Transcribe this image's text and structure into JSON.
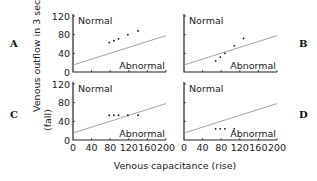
{
  "figure": {
    "ylabel_line1": "Venous outflow in 3 seconds",
    "ylabel_line2": "(fall)",
    "xlabel": "Venous capacitance (rise)",
    "region_labels": {
      "normal": "Normal",
      "abnormal": "Abnormal"
    },
    "y_ticks": [
      "0",
      "40",
      "80",
      "120"
    ],
    "x_ticks": [
      "0",
      "40",
      "80",
      "120",
      "160",
      "200"
    ],
    "colors": {
      "points": "#111111",
      "axis": "#222222",
      "reference_line": "#9a9a9a"
    }
  },
  "chart_data": [
    {
      "panel": "A",
      "type": "scatter",
      "xlabel": "Venous capacitance (rise)",
      "ylabel": "Venous outflow in 3 seconds (fall)",
      "xlim": [
        0,
        200
      ],
      "ylim": [
        0,
        120
      ],
      "x": [
        78,
        88,
        98,
        118,
        140
      ],
      "y": [
        63,
        67,
        71,
        80,
        88
      ],
      "reference_line": {
        "x": [
          0,
          200
        ],
        "y": [
          15,
          78
        ]
      },
      "annotations": [
        "Normal",
        "Abnormal"
      ]
    },
    {
      "panel": "B",
      "type": "scatter",
      "xlabel": "Venous capacitance (rise)",
      "ylabel": "Venous outflow in 3 seconds (fall)",
      "xlim": [
        0,
        200
      ],
      "ylim": [
        0,
        120
      ],
      "x": [
        68,
        78,
        88,
        108,
        128
      ],
      "y": [
        24,
        32,
        40,
        56,
        72
      ],
      "reference_line": {
        "x": [
          0,
          200
        ],
        "y": [
          15,
          78
        ]
      },
      "annotations": [
        "Normal",
        "Abnormal"
      ]
    },
    {
      "panel": "C",
      "type": "scatter",
      "xlabel": "Venous capacitance (rise)",
      "ylabel": "Venous outflow in 3 seconds (fall)",
      "xlim": [
        0,
        200
      ],
      "ylim": [
        0,
        120
      ],
      "x": [
        78,
        88,
        98,
        118,
        140
      ],
      "y": [
        53,
        53,
        53,
        53,
        53
      ],
      "reference_line": {
        "x": [
          0,
          200
        ],
        "y": [
          15,
          78
        ]
      },
      "annotations": [
        "Normal",
        "Abnormal"
      ]
    },
    {
      "panel": "D",
      "type": "scatter",
      "xlabel": "Venous capacitance (rise)",
      "ylabel": "Venous outflow in 3 seconds (fall)",
      "xlim": [
        0,
        200
      ],
      "ylim": [
        0,
        120
      ],
      "x": [
        68,
        78,
        88,
        108
      ],
      "y": [
        24,
        24,
        24,
        24
      ],
      "reference_line": {
        "x": [
          0,
          200
        ],
        "y": [
          15,
          78
        ]
      },
      "annotations": [
        "Normal",
        "Abnormal"
      ]
    }
  ]
}
